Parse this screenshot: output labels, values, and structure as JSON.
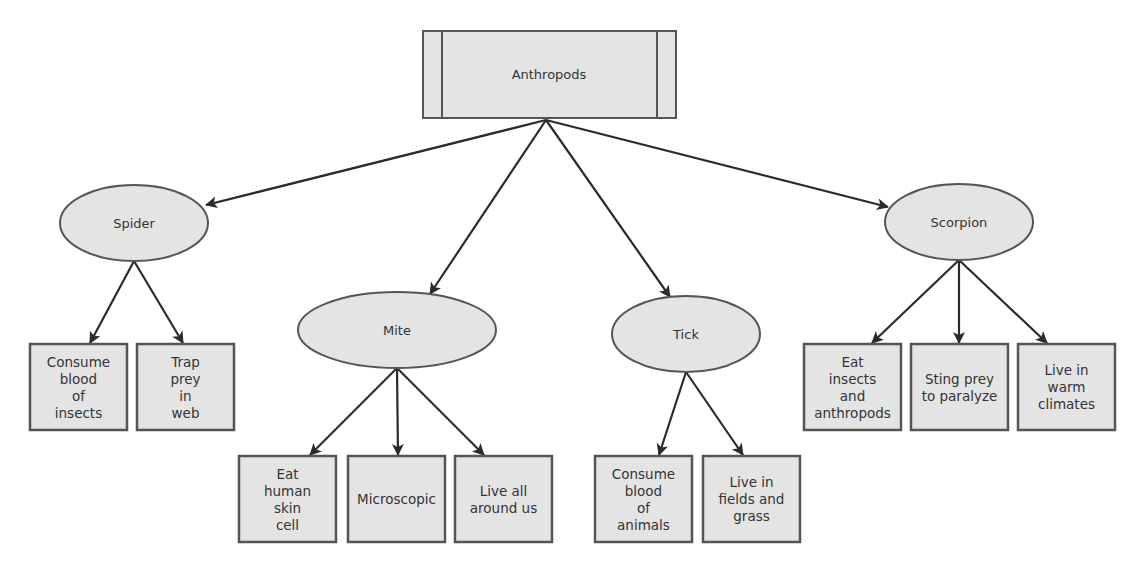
{
  "colors": {
    "fill": "#e4e4e4",
    "stroke": "#555555",
    "arrow": "#2b2b2b",
    "text": "#333333",
    "background": "#ffffff"
  },
  "root": {
    "label": "Anthropods"
  },
  "categories": [
    {
      "id": "spider",
      "label": "Spider",
      "traits": [
        [
          "Consume",
          "blood",
          "of",
          "insects"
        ],
        [
          "Trap",
          "prey",
          "in",
          "web"
        ]
      ]
    },
    {
      "id": "mite",
      "label": "Mite",
      "traits": [
        [
          "Eat",
          "human",
          "skin",
          "cell"
        ],
        [
          "Microscopic"
        ],
        [
          "Live all",
          "around us"
        ]
      ]
    },
    {
      "id": "tick",
      "label": "Tick",
      "traits": [
        [
          "Consume",
          "blood",
          "of",
          "animals"
        ],
        [
          "Live in",
          "fields and",
          "grass"
        ]
      ]
    },
    {
      "id": "scorpion",
      "label": "Scorpion",
      "traits": [
        [
          "Eat",
          "insects",
          "and",
          "anthropods"
        ],
        [
          "Sting prey",
          "to paralyze"
        ],
        [
          "Live in",
          "warm",
          "climates"
        ]
      ]
    }
  ]
}
